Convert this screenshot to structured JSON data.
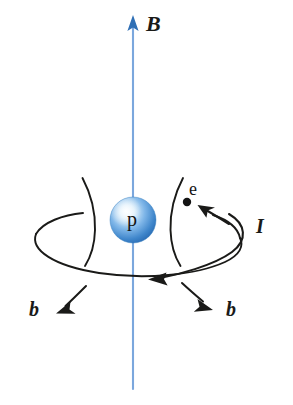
{
  "figure": {
    "title": "Magnetic field of a proton with orbiting electron",
    "background_color": "#ffffff"
  },
  "labels": {
    "field_vector": "B",
    "current": "I",
    "field_line_left": "b",
    "field_line_right": "b",
    "proton": "p",
    "electron": "e"
  },
  "colors": {
    "field_axis_line": "#7ba7dd",
    "field_arrow_head": "#2f6fb5",
    "sphere_core": "#e9f3fc",
    "sphere_mid": "#6aa9e2",
    "sphere_edge": "#2a6fb8",
    "ink": "#1a1a18"
  },
  "geometry": {
    "axis_top_y": 16,
    "axis_bottom_y": 389,
    "axis_x": 133,
    "proton_center": [
      133,
      220
    ],
    "proton_radius": 23,
    "electron_dot": [
      187,
      202
    ],
    "orbit_ellipse_center": [
      136,
      240
    ],
    "orbit_ellipse_rx": 104,
    "orbit_ellipse_ry": 36
  },
  "icons": {
    "field_arrow": "arrow-up-icon",
    "current_arrow_upper": "arrow-curved-left-icon",
    "current_arrow_lower": "arrow-left-icon",
    "b_arrow_left": "arrow-down-left-icon",
    "b_arrow_right": "arrow-down-right-icon"
  }
}
